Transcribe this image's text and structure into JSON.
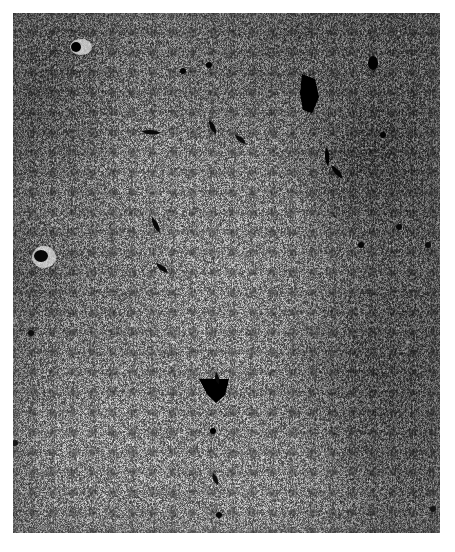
{
  "image": {
    "kind": "photomicrograph",
    "modality": "light-microscopy",
    "stain": "silver-impregnation",
    "color_mode": "grayscale",
    "caption": "",
    "label": "",
    "scale_bar": "",
    "width_px": 455,
    "height_px": 552
  },
  "plate": {
    "left_px": 13,
    "top_px": 13,
    "width_px": 427,
    "height_px": 520,
    "margin_color": "#ffffff",
    "mean_tone": "#b4b4b4",
    "darkest_tone": "#0d0d0d",
    "lightest_tone": "#f2f2f2"
  },
  "regions": [
    {
      "name": "left-dense-band",
      "tone": "dark",
      "x_range_px": [
        13,
        120
      ]
    },
    {
      "name": "central-pale-band",
      "tone": "light",
      "x_range_px": [
        170,
        300
      ]
    },
    {
      "name": "right-dense-band",
      "tone": "dark",
      "x_range_px": [
        330,
        440
      ]
    },
    {
      "name": "lower-left-pale",
      "tone": "light",
      "y_range_px": [
        400,
        533
      ]
    },
    {
      "name": "upper-fibrillar",
      "tone": "medium",
      "y_range_px": [
        13,
        200
      ]
    }
  ],
  "features": [
    {
      "name": "dark-body-upper-right",
      "shape": "irregular-wedge",
      "x_px": 300,
      "y_px": 74,
      "w_px": 22,
      "h_px": 38
    },
    {
      "name": "dark-body-lower-centre",
      "shape": "triangular",
      "x_px": 200,
      "y_px": 378,
      "w_px": 30,
      "h_px": 22
    },
    {
      "name": "vessel-upper-left",
      "shape": "round",
      "x_px": 70,
      "y_px": 34,
      "w_px": 22,
      "h_px": 16
    },
    {
      "name": "vessel-mid-left",
      "shape": "round",
      "x_px": 36,
      "y_px": 250,
      "w_px": 24,
      "h_px": 22
    },
    {
      "name": "vessel-upper-right",
      "shape": "oval",
      "x_px": 372,
      "y_px": 62,
      "w_px": 12,
      "h_px": 14
    },
    {
      "name": "cell-cluster-mid-right",
      "shape": "streak",
      "x_px": 326,
      "y_px": 148,
      "w_px": 10,
      "h_px": 30
    }
  ]
}
